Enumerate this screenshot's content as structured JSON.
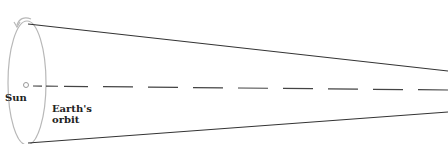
{
  "diagram": {
    "labels": {
      "sun": "Sun",
      "orbit_line1": "Earth's",
      "orbit_line2": "orbit"
    },
    "colors": {
      "lines": "#333333",
      "orbit_ellipse": "#b8b8b8",
      "sun_circle": "#999999",
      "text": "#222222"
    }
  }
}
